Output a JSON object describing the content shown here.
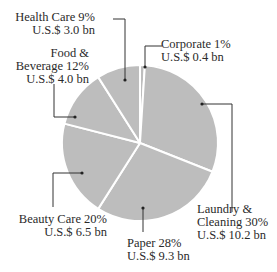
{
  "chart_data": {
    "type": "pie",
    "title": "",
    "start_angle_deg": 0,
    "direction": "clockwise",
    "slice_color": "#bdbdbd",
    "separator_color": "#ffffff",
    "slices": [
      {
        "name": "Corporate",
        "percent": 1,
        "value_label": "U.S.$ 0.4 bn",
        "value_bn": 0.4
      },
      {
        "name": "Laundry & Cleaning",
        "percent": 30,
        "value_label": "U.S.$ 10.2 bn",
        "value_bn": 10.2
      },
      {
        "name": "Paper",
        "percent": 28,
        "value_label": "U.S.$ 9.3 bn",
        "value_bn": 9.3
      },
      {
        "name": "Beauty Care",
        "percent": 20,
        "value_label": "U.S.$ 6.5 bn",
        "value_bn": 6.5
      },
      {
        "name": "Food & Beverage",
        "percent": 12,
        "value_label": "U.S.$ 4.0 bn",
        "value_bn": 4.0
      },
      {
        "name": "Health Care",
        "percent": 9,
        "value_label": "U.S.$ 3.0 bn",
        "value_bn": 3.0
      }
    ]
  },
  "labels": {
    "health": {
      "line1": "Health Care  9%",
      "line2": "U.S.$ 3.0 bn"
    },
    "food": {
      "line1": "Food &",
      "line2": "Beverage  12%",
      "line3": "U.S.$ 4.0 bn"
    },
    "corporate": {
      "line1": "Corporate  1%",
      "line2": "U.S.$ 0.4 bn"
    },
    "laundry": {
      "line1": "Laundry &",
      "line2": "Cleaning  30%",
      "line3": "U.S.$ 10.2 bn"
    },
    "paper": {
      "line1": "Paper  28%",
      "line2": "U.S.$ 9.3 bn"
    },
    "beauty": {
      "line1": "Beauty Care  20%",
      "line2": "U.S.$ 6.5 bn"
    }
  }
}
